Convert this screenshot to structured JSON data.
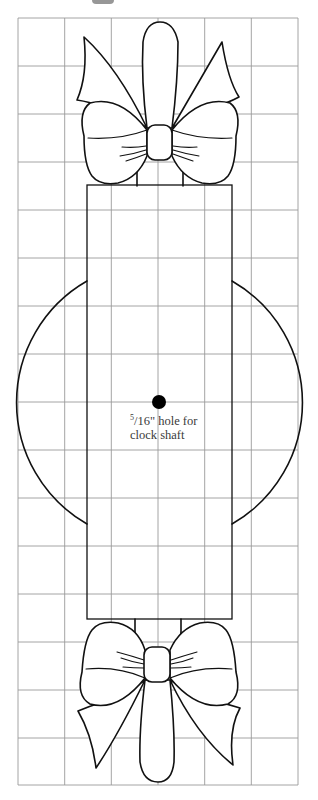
{
  "figure": {
    "grid": {
      "columns": 6,
      "rows": 16,
      "x0": 18,
      "y0": 18,
      "x1": 298,
      "y1": 785,
      "line_color": "#9a9a9a"
    },
    "body_rectangle": {
      "x": 87,
      "y": 185,
      "width": 145,
      "height": 434
    },
    "clock_face_circle": {
      "cx": 159,
      "cy": 402,
      "r": 140
    },
    "shaft_hole": {
      "cx": 159,
      "cy": 402,
      "r": 7,
      "color": "#000000"
    },
    "annotation": {
      "fraction_numerator": "5",
      "fraction_rest": "/16\" hole for",
      "line2": "clock shaft"
    },
    "bows": [
      {
        "position": "top"
      },
      {
        "position": "bottom"
      }
    ],
    "stroke_color": "#111111"
  }
}
